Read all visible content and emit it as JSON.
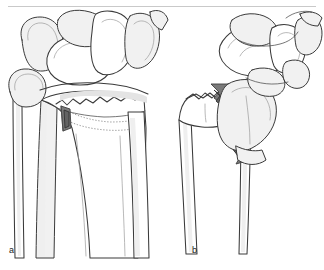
{
  "figure": {
    "kind": "medical-line-illustration",
    "panels": [
      {
        "id": "a",
        "label": "a",
        "caption_text": "a",
        "description": "non-displaced intra-articular distal radius fracture with dotted fracture outline and small dark bone fragment"
      },
      {
        "id": "b",
        "label": "b",
        "caption_text": "b",
        "description": "displaced dorsally angulated distal radius fracture with dark comminuted fracture interface"
      }
    ],
    "top_rule": {
      "visible": true,
      "color": "#c9c9c9"
    }
  },
  "colors": {
    "background": "#ffffff",
    "outline": "#3a3a3a",
    "outline_light": "#8a8a8a",
    "bone_fill": "#ffffff",
    "bone_shade": "#f0f0f0",
    "bone_shade_2": "#e6e6e6",
    "fragment_dark": "#777777",
    "fragment_darker": "#5d5d5d",
    "dotted_line": "#9a9a9a",
    "rule": "#c9c9c9",
    "label_text": "#1a1a1a"
  }
}
